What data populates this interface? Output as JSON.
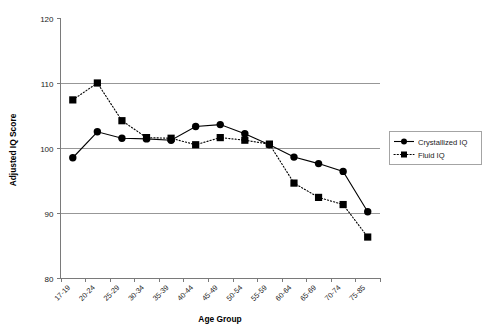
{
  "chart_data": {
    "type": "line",
    "title": "",
    "xlabel": "Age Group",
    "ylabel": "Adjusted IQ Score",
    "ylim": [
      80,
      120
    ],
    "yticks": [
      80,
      90,
      100,
      110,
      120
    ],
    "grid": "horizontal",
    "legend_position": "right",
    "categories": [
      "17-19",
      "20-24",
      "25-29",
      "30-34",
      "35-39",
      "40-44",
      "45-49",
      "50-54",
      "55-59",
      "60-64",
      "65-69",
      "70-74",
      "75-85"
    ],
    "series": [
      {
        "name": "Crystallized IQ",
        "marker": "circle",
        "line_style": "solid",
        "color": "#000000",
        "values": [
          98.5,
          102.5,
          101.5,
          101.4,
          101.2,
          103.3,
          103.6,
          102.2,
          100.5,
          98.6,
          97.6,
          96.4,
          90.2
        ]
      },
      {
        "name": "Fluid IQ",
        "marker": "square",
        "line_style": "dotted",
        "color": "#000000",
        "values": [
          107.4,
          110.0,
          104.2,
          101.6,
          101.5,
          100.5,
          101.6,
          101.2,
          100.6,
          94.6,
          92.4,
          91.3,
          86.3
        ]
      }
    ]
  },
  "axis": {
    "y_title": "Adjusted IQ Score",
    "x_title": "Age Group",
    "y_tick_labels": [
      "120",
      "110",
      "100",
      "90",
      "80"
    ],
    "x_tick_labels": [
      "17-19",
      "20-24",
      "25-29",
      "30-34",
      "35-39",
      "40-44",
      "45-49",
      "50-54",
      "55-59",
      "60-64",
      "65-69",
      "70-74",
      "75-85"
    ]
  },
  "legend": {
    "entries": [
      {
        "label": "Crystallized IQ",
        "marker": "circle",
        "style": "solid"
      },
      {
        "label": "Fluid IQ",
        "marker": "square",
        "style": "dotted"
      }
    ]
  },
  "colors": {
    "series": "#000000",
    "grid": "#8c8c8c",
    "axis": "#7a7a7a",
    "background": "#ffffff"
  }
}
